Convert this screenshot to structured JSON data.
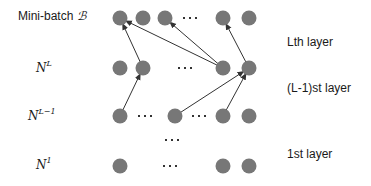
{
  "left_labels": {
    "minibatch": {
      "text": "Mini-batch ",
      "symbol": "ℬ"
    },
    "nL": {
      "base": "N",
      "sup": "L"
    },
    "nLm1": {
      "base": "N",
      "sup": "L−1"
    },
    "n1": {
      "base": "N",
      "sup": "1"
    }
  },
  "right_labels": {
    "lth": "Lth layer",
    "lm1": "(L-1)st layer",
    "first": "1st layer"
  },
  "colors": {
    "node": "#777777",
    "edge": "#333333",
    "dots": "#333333"
  },
  "rows": [
    {
      "name": "minibatch",
      "y": 18,
      "nodes": [
        120,
        143,
        165,
        223,
        249
      ],
      "dots": [
        190
      ]
    },
    {
      "name": "layer-L",
      "y": 68,
      "nodes": [
        120,
        143,
        223,
        249
      ],
      "dots": [
        185
      ]
    },
    {
      "name": "layer-L-1",
      "y": 116,
      "nodes": [
        120,
        175,
        223,
        249
      ],
      "dots": [
        145,
        199
      ]
    },
    {
      "name": "layer-gap",
      "y": 140,
      "nodes": [],
      "dots": [
        172
      ]
    },
    {
      "name": "layer-1",
      "y": 166,
      "nodes": [
        120,
        223,
        249
      ],
      "dots": [
        170
      ]
    }
  ],
  "edges": [
    {
      "from": [
        143,
        68
      ],
      "to": [
        120,
        18
      ]
    },
    {
      "from": [
        223,
        68
      ],
      "to": [
        120,
        18
      ]
    },
    {
      "from": [
        223,
        68
      ],
      "to": [
        165,
        18
      ]
    },
    {
      "from": [
        249,
        68
      ],
      "to": [
        223,
        18
      ]
    },
    {
      "from": [
        120,
        116
      ],
      "to": [
        143,
        68
      ]
    },
    {
      "from": [
        175,
        116
      ],
      "to": [
        249,
        68
      ]
    },
    {
      "from": [
        223,
        116
      ],
      "to": [
        249,
        68
      ]
    }
  ]
}
